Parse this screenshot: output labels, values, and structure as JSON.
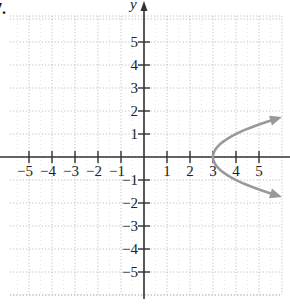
{
  "problem_label": "7.",
  "chart_data": {
    "type": "line",
    "title": "",
    "xlabel": "",
    "ylabel": "y",
    "xlim": [
      -6,
      6
    ],
    "ylim": [
      -6,
      6
    ],
    "grid": true,
    "x_ticks": [
      -5,
      -4,
      -3,
      -2,
      -1,
      1,
      2,
      3,
      4,
      5
    ],
    "y_ticks": [
      -5,
      -4,
      -3,
      -2,
      -1,
      1,
      2,
      3,
      4,
      5
    ],
    "x_tick_labels": [
      "−5",
      "−4",
      "−3",
      "−2",
      "−1",
      "1",
      "2",
      "3",
      "4",
      "5"
    ],
    "y_tick_labels": [
      "−5",
      "−4",
      "−3",
      "−2",
      "−1",
      "1",
      "2",
      "3",
      "4",
      "5"
    ],
    "series": [
      {
        "name": "x = y^2 + 3",
        "color": "#999999",
        "arrows": "both-ends",
        "vertex": [
          3,
          0
        ],
        "points": [
          {
            "x": 5.9,
            "y": -1.7
          },
          {
            "x": 5.25,
            "y": -1.5
          },
          {
            "x": 4.44,
            "y": -1.2
          },
          {
            "x": 3.81,
            "y": -0.9
          },
          {
            "x": 3.36,
            "y": -0.6
          },
          {
            "x": 3.09,
            "y": -0.3
          },
          {
            "x": 3.0,
            "y": 0
          },
          {
            "x": 3.09,
            "y": 0.3
          },
          {
            "x": 3.36,
            "y": 0.6
          },
          {
            "x": 3.81,
            "y": 0.9
          },
          {
            "x": 4.44,
            "y": 1.2
          },
          {
            "x": 5.25,
            "y": 1.5
          },
          {
            "x": 5.9,
            "y": 1.7
          }
        ]
      }
    ]
  },
  "style": {
    "axis_color": "#333333",
    "grid_color": "#b0b0b0",
    "curve_color": "#999999"
  }
}
